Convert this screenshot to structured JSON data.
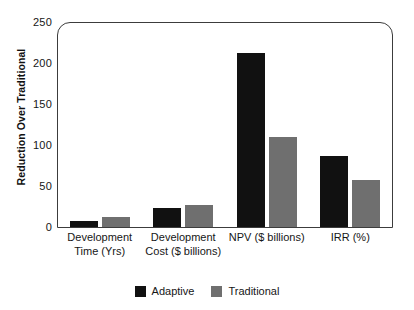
{
  "chart_data": {
    "type": "bar",
    "title": "",
    "xlabel": "",
    "ylabel": "Reduction Over Traditional",
    "ylim": [
      0,
      250
    ],
    "yticks": [
      0,
      50,
      100,
      150,
      200,
      250
    ],
    "grid": false,
    "legend_position": "bottom-center",
    "categories": [
      "Development Time (Yrs)",
      "Development Cost ($ billions)",
      "NPV ($ billions)",
      "IRR (%)"
    ],
    "category_lines": [
      [
        "Development",
        "Time (Yrs)"
      ],
      [
        "Development",
        "Cost ($ billions)"
      ],
      [
        "NPV ($ billions)"
      ],
      [
        "IRR (%)"
      ]
    ],
    "series": [
      {
        "name": "Adaptive",
        "color": "#111111",
        "values": [
          7,
          23,
          212,
          87
        ]
      },
      {
        "name": "Traditional",
        "color": "#6f6f6f",
        "values": [
          12,
          27,
          110,
          57
        ]
      }
    ]
  },
  "axis": {
    "y_title": "Reduction Over Traditional",
    "y_tick_labels": [
      "250",
      "200",
      "150",
      "100",
      "50",
      "0"
    ]
  },
  "legend": {
    "entries": [
      {
        "label": "Adaptive",
        "color": "#111111"
      },
      {
        "label": "Traditional",
        "color": "#6f6f6f"
      }
    ]
  },
  "colors": {
    "adaptive": "#111111",
    "traditional": "#6f6f6f",
    "axis": "#3c3c3c",
    "background": "#ffffff"
  }
}
